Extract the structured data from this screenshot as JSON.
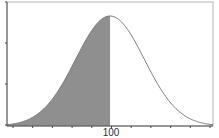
{
  "chart_data": {
    "type": "area",
    "title": "",
    "xlabel": "",
    "ylabel": "",
    "distribution": {
      "mean": 100,
      "sd": 15
    },
    "shaded_region": {
      "from": "-inf",
      "to": 100,
      "label": "P(X < 100) = 0.5"
    },
    "x_tick_labels": [
      "100"
    ],
    "x_ticks_count": 11,
    "y_ticks_count": 4,
    "xlim": [
      55,
      145
    ],
    "ylim": [
      0,
      1
    ],
    "grid": false,
    "legend": null,
    "colors": {
      "fill": "#8f8f8f",
      "curve": "#7a7a7a",
      "axis": "#555555",
      "frame": "#b0b0b0"
    }
  },
  "axis": {
    "x_label_center": "100"
  }
}
